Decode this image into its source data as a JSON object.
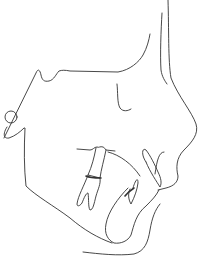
{
  "figure": {
    "type": "cephalometric-tracing",
    "view": "lateral-profile",
    "background": "#ffffff",
    "stroke_color": "#333333"
  },
  "structures": [
    {
      "name": "soft-tissue-profile",
      "path": "M168 0 C169 30 168 60 172 80 C180 100 195 115 197 128 C199 138 190 145 183 152 C175 160 178 168 180 178 C176 185 165 188 160 192"
    },
    {
      "name": "nasal-bone-line",
      "path": "M162 13 C162 30 160 55 161 72 C162 78 165 82 167 84"
    },
    {
      "name": "cranial-base",
      "path": "M3 137 L38 70 C40 68 41 78 43 80 C46 84 52 82 56 75 C59 70 63 71 70 71 L115 72 C128 70 138 62 143 54 C147 47 150 40 150 35"
    },
    {
      "name": "orbit-floor",
      "path": "M117 84 C118 92 117 105 121 110 C124 112 128 111 131 109"
    },
    {
      "name": "ear-rod",
      "cx": 11,
      "cy": 117,
      "r": 6
    },
    {
      "name": "mandible-ramus",
      "path": "M8 126 C4 132 4 138 10 138 C15 137 20 132 24 128 M23 128 C24 150 24 170 26 185 C35 195 55 205 72 220 C85 232 100 240 113 244"
    },
    {
      "name": "upper-molar",
      "path": "M77 149 L90 150 C94 150 94 146 98 147 C100 146 102 147 105 148 L115 151 M96 148 C94 158 92 166 90 175 L101 178 C102 170 104 160 106 150"
    },
    {
      "name": "lower-molar",
      "path": "M90 175 C86 186 80 196 78 204 C78 206 80 206 82 204 C84 198 86 192 88 192 C89 198 89 206 90 210 C93 210 94 204 96 196 C98 190 101 184 101 178"
    },
    {
      "name": "palatal-line",
      "path": "M108 152 C118 155 130 162 138 172"
    },
    {
      "name": "upper-incisor",
      "path": "M145 162 C141 155 142 148 146 150 C150 155 155 165 158 172 C161 178 162 183 160 186 C157 182 150 172 145 162"
    },
    {
      "name": "lower-incisor",
      "path": "M132 186 C134 180 138 176 138 183 C136 190 134 196 131 203 C128 198 128 192 130 188"
    },
    {
      "name": "symphysis",
      "path": "M130 188 C118 200 108 215 105 225 C103 235 107 240 113 243 C120 245 128 242 131 236 C134 226 136 214 146 206 C152 199 157 196 160 190"
    },
    {
      "name": "soft-tissue-chin",
      "path": "M83 252 C100 254 118 256 135 253 C146 250 148 240 150 228 C152 216 156 208 160 204"
    }
  ],
  "labels": []
}
